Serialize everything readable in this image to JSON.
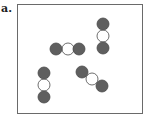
{
  "panel_label": "a.",
  "colors": {
    "dark_atom": "#5f5f5f",
    "light_atom": "#ffffff",
    "outline": "#4a4a4a",
    "frame": "#6a6a6a"
  },
  "molecules": [
    {
      "id": "horizontal",
      "atoms": [
        {
          "x": 56,
          "y": 49,
          "type": "dark"
        },
        {
          "x": 68,
          "y": 49,
          "type": "light"
        },
        {
          "x": 79,
          "y": 49,
          "type": "dark"
        }
      ]
    },
    {
      "id": "vertical-top-right",
      "atoms": [
        {
          "x": 103,
          "y": 24,
          "type": "dark"
        },
        {
          "x": 103,
          "y": 36,
          "type": "light"
        },
        {
          "x": 103,
          "y": 48,
          "type": "dark"
        }
      ]
    },
    {
      "id": "vertical-bottom-left",
      "atoms": [
        {
          "x": 44,
          "y": 73,
          "type": "dark"
        },
        {
          "x": 44,
          "y": 85,
          "type": "light"
        },
        {
          "x": 44,
          "y": 97,
          "type": "dark"
        }
      ]
    },
    {
      "id": "diagonal",
      "atoms": [
        {
          "x": 82,
          "y": 72,
          "type": "dark"
        },
        {
          "x": 92,
          "y": 79,
          "type": "light"
        },
        {
          "x": 102,
          "y": 86,
          "type": "dark"
        }
      ]
    }
  ]
}
